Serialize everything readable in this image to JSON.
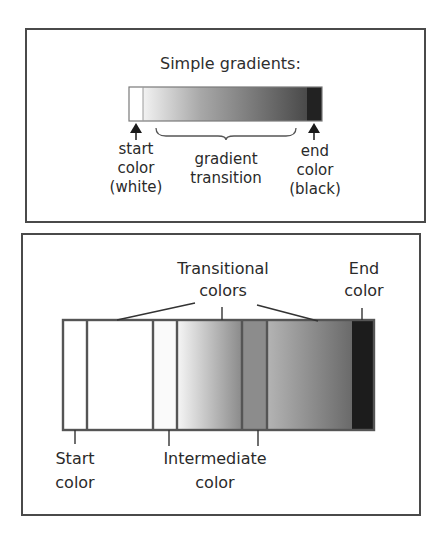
{
  "top_panel": {
    "title": "Simple gradients:",
    "labels": {
      "start": [
        "start",
        "color",
        "(white)"
      ],
      "transition": [
        "gradient",
        "transition"
      ],
      "end": [
        "end",
        "color",
        "(black)"
      ]
    },
    "colors": {
      "start": "#ffffff",
      "end": "#1e1e1e"
    }
  },
  "bottom_panel": {
    "labels": {
      "transitional": [
        "Transitional",
        "colors"
      ],
      "end": [
        "End",
        "color"
      ],
      "start": [
        "Start",
        "color"
      ],
      "intermediate": [
        "Intermediate",
        "color"
      ]
    },
    "segments": [
      {
        "name": "start-color",
        "color": "#ffffff"
      },
      {
        "name": "transition-1",
        "color": "#ffffff"
      },
      {
        "name": "intermediate-1",
        "color": "#fafafa"
      },
      {
        "name": "transition-2",
        "from": "#f4f4f4",
        "to": "#8a8a8a"
      },
      {
        "name": "intermediate-2",
        "color": "#8c8c8c"
      },
      {
        "name": "transition-3",
        "from": "#b0b0b0",
        "to": "#6a6a6a"
      },
      {
        "name": "end-color",
        "color": "#1c1c1c"
      }
    ]
  }
}
